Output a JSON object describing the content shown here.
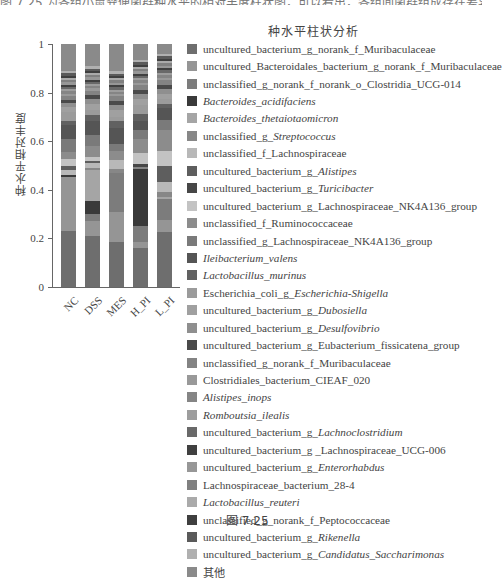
{
  "page": {
    "top_cut_text": "图 7.25 为各组小鼠粪便菌群种水平的相对丰度柱状图，可以看出，各组间菌群组成存在差异。",
    "caption": "图 7.25"
  },
  "chart_data": {
    "type": "bar",
    "stacked": true,
    "title": "种水平柱状分析",
    "xlabel": "",
    "ylabel": "种水平相对丰度",
    "ylim": [
      0,
      1
    ],
    "yticks": [
      "0",
      "0.2",
      "0.4",
      "0.6",
      "0.8",
      "1"
    ],
    "categories": [
      "NC",
      "DSS",
      "MES",
      "H_PI",
      "L_PI"
    ],
    "grid": false,
    "legend_position": "right",
    "colormap": "grayscale",
    "series": [
      {
        "name": "uncultured_bacterium_g_norank_f_Muribaculaceae",
        "color": "#6e6e6e",
        "values": [
          0.25,
          0.23,
          0.2,
          0.17,
          0.23
        ]
      },
      {
        "name": "uncultured_Bacteroidales_bacterium_g_norank_f_Muribaculaceae",
        "color": "#959595",
        "values": [
          0.24,
          0.07,
          0.13,
          0.03,
          0.05
        ]
      },
      {
        "name": "unclassified_g_norank_f_norank_o_Clostridia_UCG-014",
        "color": "#7c7c7c",
        "values": [
          0.0,
          0.03,
          0.17,
          0.07,
          0.09
        ]
      },
      {
        "name": "Bacteroides_acidifaciens",
        "color": "#3a3a3a",
        "values": [
          0.01,
          0.06,
          0.0,
          0.25,
          0.0
        ]
      },
      {
        "name": "Bacteroides_thetaiotaomicron",
        "color": "#a5a5a5",
        "values": [
          0.0,
          0.14,
          0.0,
          0.0,
          0.01
        ]
      },
      {
        "name": "unclassified_g_Streptococcus",
        "color": "#878787",
        "values": [
          0.0,
          0.01,
          0.02,
          0.01,
          0.02
        ]
      },
      {
        "name": "unclassified_f_Lachnospiraceae",
        "color": "#b8b8b8",
        "values": [
          0.02,
          0.02,
          0.04,
          0.0,
          0.04
        ]
      },
      {
        "name": "uncultured_bacterium_g_Alistipes",
        "color": "#5e5e5e",
        "values": [
          0.02,
          0.01,
          0.0,
          0.0,
          0.07
        ]
      },
      {
        "name": "uncultured_bacterium_g_Turicibacter",
        "color": "#474747",
        "values": [
          0.0,
          0.0,
          0.0,
          0.01,
          0.0
        ]
      },
      {
        "name": "uncultured_bacterium_g_Lachnospiraceae_NK4A136_group",
        "color": "#c3c3c3",
        "values": [
          0.03,
          0.02,
          0.0,
          0.05,
          0.06
        ]
      },
      {
        "name": "unclassified_f_Ruminococcaceae",
        "color": "#8c8c8c",
        "values": [
          0.03,
          0.05,
          0.04,
          0.06,
          0.09
        ]
      },
      {
        "name": "unclassified_g_Lachnospiraceae_NK4A136_group",
        "color": "#7a7a7a",
        "values": [
          0.06,
          0.05,
          0.03,
          0.04,
          0.04
        ]
      },
      {
        "name": "Ileibacterium_valens",
        "color": "#555555",
        "values": [
          0.06,
          0.06,
          0.07,
          0.04,
          0.05
        ]
      },
      {
        "name": "Lactobacillus_murinus",
        "color": "#616161",
        "values": [
          0.02,
          0.03,
          0.03,
          0.03,
          0.02
        ]
      },
      {
        "name": "Escherichia_coli_g_Escherichia-Shigella",
        "color": "#9b9b9b",
        "values": [
          0.04,
          0.02,
          0.02,
          0.04,
          0.02
        ]
      },
      {
        "name": "uncultured_bacterium_g_Dubosiella",
        "color": "#a0a0a0",
        "values": [
          0.02,
          0.03,
          0.03,
          0.03,
          0.02
        ]
      },
      {
        "name": "uncultured_bacterium_g_Desulfovibrio",
        "color": "#8f8f8f",
        "values": [
          0.02,
          0.02,
          0.02,
          0.02,
          0.02
        ]
      },
      {
        "name": "uncultured_bacterium_g_Eubacterium_fissicatena_group",
        "color": "#4a4a4a",
        "values": [
          0.01,
          0.02,
          0.02,
          0.02,
          0.02
        ]
      },
      {
        "name": "unclassified_g_norank_f_Muribaculaceae",
        "color": "#838383",
        "values": [
          0.02,
          0.02,
          0.02,
          0.02,
          0.02
        ]
      },
      {
        "name": "Clostridiales_bacterium_CIEAF_020",
        "color": "#999999",
        "values": [
          0.01,
          0.01,
          0.01,
          0.01,
          0.01
        ]
      },
      {
        "name": "Alistipes_inops",
        "color": "#858585",
        "values": [
          0.01,
          0.01,
          0.01,
          0.01,
          0.01
        ]
      },
      {
        "name": "Romboutsia_ilealis",
        "color": "#9d9d9d",
        "values": [
          0.01,
          0.01,
          0.01,
          0.01,
          0.01
        ]
      },
      {
        "name": "uncultured_bacterium_g_Lachnoclostridium",
        "color": "#696969",
        "values": [
          0.01,
          0.01,
          0.01,
          0.01,
          0.01
        ]
      },
      {
        "name": "uncultured_bacterium_g_Lachnospiraceae_UCG-006",
        "color": "#404040",
        "values": [
          0.01,
          0.01,
          0.01,
          0.01,
          0.01
        ]
      },
      {
        "name": "uncultured_bacterium_g_Enterorhabdus",
        "color": "#979797",
        "values": [
          0.01,
          0.01,
          0.01,
          0.01,
          0.01
        ]
      },
      {
        "name": "Lachnospiraceae_bacterium_28-4",
        "color": "#808080",
        "values": [
          0.01,
          0.01,
          0.01,
          0.01,
          0.01
        ]
      },
      {
        "name": "Lactobacillus_reuteri",
        "color": "#aaaaaa",
        "values": [
          0.01,
          0.01,
          0.01,
          0.01,
          0.01
        ]
      },
      {
        "name": "unclassified_g_norank_f_Peptococcaceae",
        "color": "#3f3f3f",
        "values": [
          0.01,
          0.01,
          0.01,
          0.01,
          0.01
        ]
      },
      {
        "name": "uncultured_bacterium_g_Rikenella",
        "color": "#5a5a5a",
        "values": [
          0.01,
          0.01,
          0.01,
          0.01,
          0.01
        ]
      },
      {
        "name": "uncultured_bacterium_g_Candidatus_Saccharimonas",
        "color": "#b0b0b0",
        "values": [
          0.01,
          0.01,
          0.01,
          0.01,
          0.01
        ]
      },
      {
        "name": "其他",
        "color": "#8a8a8a",
        "values": [
          0.12,
          0.1,
          0.12,
          0.07,
          0.04
        ]
      }
    ]
  },
  "legend": {
    "items": [
      {
        "pre": "uncultured_bacterium_g_norank_f_Muribaculaceae",
        "it": ""
      },
      {
        "pre": "uncultured_Bacteroidales_bacterium_g_norank_f_Muribaculaceae",
        "it": ""
      },
      {
        "pre": "unclassified_g_norank_f_norank_o_Clostridia_UCG-014",
        "it": ""
      },
      {
        "pre": "",
        "it": "Bacteroides_acidifaciens"
      },
      {
        "pre": "",
        "it": "Bacteroides_thetaiotaomicron"
      },
      {
        "pre": "unclassified_g_",
        "it": "Streptococcus"
      },
      {
        "pre": "unclassified_f_Lachnospiraceae",
        "it": ""
      },
      {
        "pre": "uncultured_bacterium_g_",
        "it": "Alistipes"
      },
      {
        "pre": "uncultured_bacterium_g_",
        "it": "Turicibacter"
      },
      {
        "pre": "uncultured_bacterium_g_Lachnospiraceae_NK4A136_group",
        "it": ""
      },
      {
        "pre": "unclassified_f_Ruminococcaceae",
        "it": ""
      },
      {
        "pre": "unclassified_g_Lachnospiraceae_NK4A136_group",
        "it": ""
      },
      {
        "pre": "",
        "it": "Ileibacterium_valens"
      },
      {
        "pre": "",
        "it": "Lactobacillus_murinus"
      },
      {
        "pre": "Escherichia_coli_g_",
        "it": "Escherichia-Shigella"
      },
      {
        "pre": "uncultured_bacterium_g_",
        "it": "Dubosiella"
      },
      {
        "pre": "uncultured_bacterium_g_",
        "it": "Desulfovibrio"
      },
      {
        "pre": "uncultured_bacterium_g_Eubacterium_fissicatena_group",
        "it": ""
      },
      {
        "pre": "unclassified_g_norank_f_Muribaculaceae",
        "it": ""
      },
      {
        "pre": "Clostridiales_bacterium_CIEAF_020",
        "it": ""
      },
      {
        "pre": "",
        "it": "Alistipes_inops"
      },
      {
        "pre": "",
        "it": "Romboutsia_ilealis"
      },
      {
        "pre": "uncultured_bacterium_g_",
        "it": "Lachnoclostridium"
      },
      {
        "pre": "uncultured_bacterium_g _Lachnospiraceae_UCG-006",
        "it": ""
      },
      {
        "pre": "uncultured_bacterium_g_",
        "it": "Enterorhabdus"
      },
      {
        "pre": "Lachnospiraceae_bacterium_28-4",
        "it": ""
      },
      {
        "pre": "",
        "it": "Lactobacillus_reuteri"
      },
      {
        "pre": "unclassified_g_norank_f_Peptococcaceae",
        "it": ""
      },
      {
        "pre": "uncultured_bacterium_g_",
        "it": "Rikenella"
      },
      {
        "pre": "uncultured_bacterium_g_",
        "it": "Candidatus_Saccharimonas"
      },
      {
        "pre": "其他",
        "it": ""
      }
    ]
  }
}
